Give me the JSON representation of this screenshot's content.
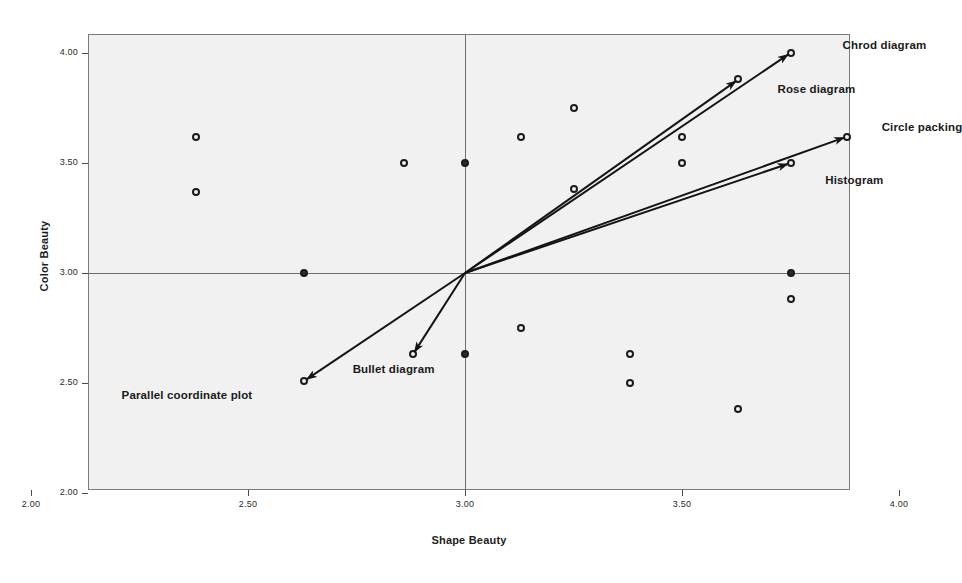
{
  "chart_data": {
    "type": "scatter",
    "title": "",
    "xlabel": "Shape Beauty",
    "ylabel": "Color Beauty",
    "xlim": [
      1.88,
      4.12
    ],
    "ylim": [
      1.88,
      4.12
    ],
    "xticks": [
      "2.00",
      "2.50",
      "3.00",
      "3.50",
      "4.00"
    ],
    "yticks": [
      "2.00",
      "2.50",
      "3.00",
      "3.50",
      "4.00"
    ],
    "xtick_values": [
      2.0,
      2.5,
      3.0,
      3.5,
      4.0
    ],
    "ytick_values": [
      2.0,
      2.5,
      3.0,
      3.5,
      4.0
    ],
    "grid": false,
    "legend": "none",
    "reference_lines": {
      "vertical_x": 3.0,
      "horizontal_y": 3.0
    },
    "origin": [
      3.0,
      3.0
    ],
    "points": [
      {
        "x": 2.38,
        "y": 3.62
      },
      {
        "x": 2.38,
        "y": 3.37
      },
      {
        "x": 2.63,
        "y": 3.0
      },
      {
        "x": 2.63,
        "y": 2.51,
        "label": "Parallel coordinate plot"
      },
      {
        "x": 2.86,
        "y": 3.5
      },
      {
        "x": 2.88,
        "y": 2.63,
        "label": "Bullet diagram"
      },
      {
        "x": 3.0,
        "y": 3.5
      },
      {
        "x": 3.0,
        "y": 2.63
      },
      {
        "x": 3.13,
        "y": 3.62
      },
      {
        "x": 3.13,
        "y": 2.75
      },
      {
        "x": 3.25,
        "y": 3.75
      },
      {
        "x": 3.25,
        "y": 3.38
      },
      {
        "x": 3.38,
        "y": 2.63
      },
      {
        "x": 3.38,
        "y": 2.5
      },
      {
        "x": 3.5,
        "y": 3.62
      },
      {
        "x": 3.5,
        "y": 3.5
      },
      {
        "x": 3.63,
        "y": 2.38
      },
      {
        "x": 3.75,
        "y": 3.0
      },
      {
        "x": 3.75,
        "y": 2.88
      },
      {
        "x": 3.75,
        "y": 4.0,
        "label": "Chrod diagram"
      },
      {
        "x": 3.63,
        "y": 3.88,
        "label": "Rose diagram"
      },
      {
        "x": 3.88,
        "y": 3.62,
        "label": "Circle packing"
      },
      {
        "x": 3.75,
        "y": 3.5,
        "label": "Histogram"
      }
    ],
    "vectors": [
      {
        "name": "Chrod diagram",
        "from": [
          3.0,
          3.0
        ],
        "to": [
          3.75,
          4.0
        ],
        "label_x": 3.87,
        "label_y": 4.03
      },
      {
        "name": "Rose diagram",
        "from": [
          3.0,
          3.0
        ],
        "to": [
          3.63,
          3.88
        ],
        "label_x": 3.72,
        "label_y": 3.83
      },
      {
        "name": "Circle packing",
        "from": [
          3.0,
          3.0
        ],
        "to": [
          3.88,
          3.62
        ],
        "label_x": 3.96,
        "label_y": 3.66
      },
      {
        "name": "Histogram",
        "from": [
          3.0,
          3.0
        ],
        "to": [
          3.75,
          3.5
        ],
        "label_x": 3.83,
        "label_y": 3.42
      },
      {
        "name": "Bullet diagram",
        "from": [
          3.0,
          3.0
        ],
        "to": [
          2.88,
          2.63
        ],
        "label_x": 2.93,
        "label_y": 2.56
      },
      {
        "name": "Parallel coordinate plot",
        "from": [
          3.0,
          3.0
        ],
        "to": [
          2.63,
          2.51
        ],
        "label_x": 2.51,
        "label_y": 2.44
      }
    ],
    "colors": {
      "plot_background": "#f1f1f1",
      "frame": "#7b7b7b",
      "reference_line": "#6e6e6e",
      "point_stroke": "#1b1b1b",
      "vector": "#141414",
      "text": "#1a1a1a"
    }
  },
  "bleed_text": [
    {
      "t": "and other areas in that the graphic forms",
      "x": 100,
      "y": 42,
      "size": 15
    },
    {
      "t": "Ling V. Fong L. Wong Q. Chen and Lyn",
      "x": 104,
      "y": 70,
      "size": 15
    },
    {
      "t": "such as a Word D. Chen. P. Liu in that",
      "x": 118,
      "y": 96,
      "size": 15
    },
    {
      "t": "350          J.L.            Yang",
      "x": 128,
      "y": 126,
      "size": 18
    },
    {
      "t": "100       Wood    M.W.    Perk",
      "x": 128,
      "y": 182,
      "size": 18
    },
    {
      "t": "The Visual     of the visual design",
      "x": 132,
      "y": 212,
      "size": 14
    },
    {
      "t": "design",
      "x": 560,
      "y": 318,
      "size": 17
    },
    {
      "t": "paper explores the mountains of the visual beauty of graphic",
      "x": 96,
      "y": 372,
      "size": 14
    },
    {
      "t": "visual images. The work flows in this research of infographic",
      "x": 96,
      "y": 398,
      "size": 14
    },
    {
      "t": "summaries on of the design discussions, the survey in on the result",
      "x": 96,
      "y": 424,
      "size": 14
    },
    {
      "t": "main topic, and the found the mapping and is the key factor in data",
      "x": 96,
      "y": 450,
      "size": 14
    }
  ]
}
